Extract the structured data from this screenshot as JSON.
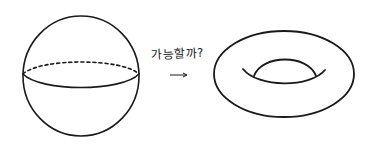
{
  "caption": "가능할까?",
  "arrow": "→",
  "figures": [
    {
      "name": "sphere",
      "description": "sphere with dashed back equator and solid front equator"
    },
    {
      "name": "torus",
      "description": "torus (donut) with inner hole curves"
    }
  ],
  "colors": {
    "stroke": "#1a1a1a",
    "background": "#ffffff"
  }
}
